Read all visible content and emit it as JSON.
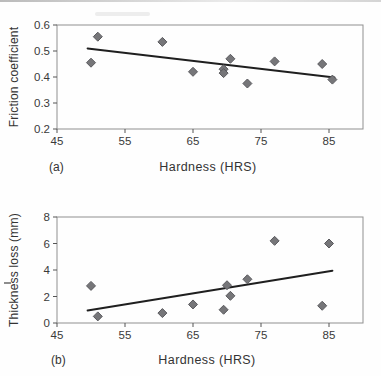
{
  "figure_caption": {
    "panel_a": "(a)",
    "panel_b": "(b)"
  },
  "chart_data": [
    {
      "type": "scatter",
      "panel_label": "(a)",
      "xlabel": "Hardness (HRS)",
      "ylabel": "Friction coefficient",
      "xlim": [
        45,
        90
      ],
      "ylim": [
        0.2,
        0.6
      ],
      "xticks": [
        "45",
        "55",
        "65",
        "75",
        "85"
      ],
      "yticks": [
        "0.2",
        "0.3",
        "0.4",
        "0.5",
        "0.6"
      ],
      "grid": false,
      "legend": "none",
      "marker": "diamond",
      "points": [
        [
          50,
          0.455
        ],
        [
          51,
          0.555
        ],
        [
          60.5,
          0.535
        ],
        [
          65,
          0.42
        ],
        [
          69.5,
          0.43
        ],
        [
          69.5,
          0.415
        ],
        [
          70.5,
          0.47
        ],
        [
          73,
          0.375
        ],
        [
          77,
          0.46
        ],
        [
          84,
          0.45
        ],
        [
          85.5,
          0.39
        ]
      ],
      "trendline": {
        "x1": 49.5,
        "y1": 0.51,
        "x2": 85.8,
        "y2": 0.398
      },
      "colors": {
        "marker": "#767679",
        "marker_edge": "#5a5a5e",
        "trend": "#1f1f1f",
        "frame": "#909090",
        "axis": "#555555",
        "text": "#3a3a3a"
      }
    },
    {
      "type": "scatter",
      "panel_label": "(b)",
      "xlabel": "Hardness (HRS)",
      "ylabel": "Thickness loss (mm)",
      "xlim": [
        45,
        90
      ],
      "ylim": [
        0,
        8
      ],
      "xticks": [
        "45",
        "55",
        "65",
        "75",
        "85"
      ],
      "yticks": [
        "0",
        "2",
        "4",
        "6",
        "8"
      ],
      "grid": false,
      "legend": "none",
      "marker": "diamond",
      "points": [
        [
          50,
          2.8
        ],
        [
          51,
          0.5
        ],
        [
          60.5,
          0.75
        ],
        [
          65,
          1.4
        ],
        [
          69.5,
          1.0
        ],
        [
          70,
          2.85
        ],
        [
          70.5,
          2.05
        ],
        [
          73,
          3.3
        ],
        [
          77,
          6.2
        ],
        [
          84,
          1.3
        ],
        [
          85,
          6.0
        ]
      ],
      "trendline": {
        "x1": 49.5,
        "y1": 0.95,
        "x2": 85.5,
        "y2": 3.95
      },
      "colors": {
        "marker": "#767679",
        "marker_edge": "#5a5a5e",
        "trend": "#1f1f1f",
        "frame": "#909090",
        "axis": "#555555",
        "text": "#3a3a3a"
      }
    }
  ]
}
